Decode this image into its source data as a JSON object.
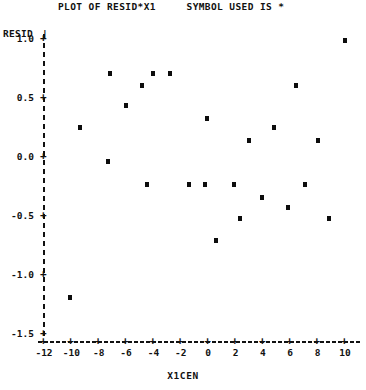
{
  "title": "PLOT OF RESID*X1     SYMBOL USED IS *",
  "axis_titles": {
    "y": "RESID",
    "y_bar": "|",
    "x": "X1CEN"
  },
  "chart_data": {
    "type": "scatter",
    "title": "PLOT OF RESID*X1     SYMBOL USED IS *",
    "xlabel": "X1CEN",
    "ylabel": "RESID",
    "symbol": "*",
    "xlim": [
      -12,
      10
    ],
    "ylim": [
      -1.6,
      1.1
    ],
    "xticks": [
      -12,
      -10,
      -8,
      -6,
      -4,
      -2,
      0,
      2,
      4,
      6,
      8,
      10
    ],
    "xticklabels": [
      "-12",
      "-10",
      "-8",
      "-6",
      "-4",
      "-2",
      "0",
      "2",
      "4",
      "6",
      "8",
      "10"
    ],
    "yticks": [
      1.0,
      0.5,
      0.0,
      -0.5,
      -1.0,
      -1.5
    ],
    "yticklabels": [
      "1.0",
      "0.5",
      "0.0",
      "-0.5",
      "-1.0",
      "-1.5"
    ],
    "grid": false,
    "legend": "none",
    "series": [
      {
        "name": "RESID vs X1CEN",
        "points": [
          {
            "x": -7.2,
            "y": 0.7
          },
          {
            "x": -4.0,
            "y": 0.7
          },
          {
            "x": -2.8,
            "y": 0.7
          },
          {
            "x": -4.8,
            "y": 0.6
          },
          {
            "x": -6.0,
            "y": 0.43
          },
          {
            "x": -9.4,
            "y": 0.24
          },
          {
            "x": -0.1,
            "y": 0.32
          },
          {
            "x": 4.8,
            "y": 0.24
          },
          {
            "x": 10.0,
            "y": 0.98
          },
          {
            "x": 6.4,
            "y": 0.6
          },
          {
            "x": 3.0,
            "y": 0.13
          },
          {
            "x": 8.0,
            "y": 0.13
          },
          {
            "x": -7.3,
            "y": -0.05
          },
          {
            "x": -4.5,
            "y": -0.24
          },
          {
            "x": -1.4,
            "y": -0.24
          },
          {
            "x": -0.2,
            "y": -0.24
          },
          {
            "x": 1.9,
            "y": -0.24
          },
          {
            "x": 7.1,
            "y": -0.24
          },
          {
            "x": 3.9,
            "y": -0.35
          },
          {
            "x": 5.8,
            "y": -0.44
          },
          {
            "x": 2.3,
            "y": -0.53
          },
          {
            "x": 8.8,
            "y": -0.53
          },
          {
            "x": 0.6,
            "y": -0.72
          },
          {
            "x": -10.1,
            "y": -1.2
          }
        ]
      }
    ]
  },
  "y_axis_ticks": [
    {
      "label": " 1.0",
      "value": 1.0
    },
    {
      "label": " 0.5",
      "value": 0.5
    },
    {
      "label": " 0.0",
      "value": 0.0
    },
    {
      "label": "-0.5",
      "value": -0.5
    },
    {
      "label": "-1.0",
      "value": -1.0
    },
    {
      "label": "-1.5",
      "value": -1.5
    }
  ],
  "x_axis_ticks": [
    {
      "label": "-12",
      "value": -12
    },
    {
      "label": "-10",
      "value": -10
    },
    {
      "label": "-8",
      "value": -8
    },
    {
      "label": "-6",
      "value": -6
    },
    {
      "label": "-4",
      "value": -4
    },
    {
      "label": "-2",
      "value": -2
    },
    {
      "label": "0",
      "value": 0
    },
    {
      "label": "2",
      "value": 2
    },
    {
      "label": "4",
      "value": 4
    },
    {
      "label": "6",
      "value": 6
    },
    {
      "label": "8",
      "value": 8
    },
    {
      "label": "10",
      "value": 10
    }
  ]
}
